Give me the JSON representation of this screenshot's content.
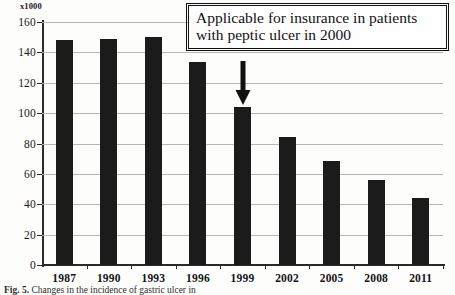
{
  "chart_data": {
    "type": "bar",
    "title": "",
    "subtitle": "",
    "xlabel": "",
    "ylabel": "",
    "unit_label": "x1000",
    "categories": [
      "1987",
      "1990",
      "1993",
      "1996",
      "1999",
      "2002",
      "2005",
      "2008",
      "2011"
    ],
    "values": [
      148,
      148.5,
      150,
      133.5,
      104,
      84,
      68.5,
      56,
      44
    ],
    "series": [
      {
        "name": "",
        "values": [
          148,
          148.5,
          150,
          133.5,
          104,
          84,
          68.5,
          56,
          44
        ]
      }
    ],
    "ylim": [
      0,
      160
    ],
    "ytick_labels": [
      "0",
      "20",
      "40",
      "60",
      "80",
      "100",
      "120",
      "140",
      "160"
    ],
    "ytick_values": [
      0,
      20,
      40,
      60,
      80,
      100,
      120,
      140,
      160
    ],
    "grid": true,
    "grid_axis": "y",
    "legend": false,
    "legend_position": "none",
    "bar_color": "#1b1b1b",
    "gridline_color": "#b9b9b4",
    "axis_color": "#2a2a2a",
    "background_color": "#fdfdfc",
    "annotations": [
      {
        "name": "callout",
        "lines": [
          "Applicable for insurance in patients",
          "with peptic ulcer in 2000"
        ],
        "points_to_category": "1999",
        "arrow": "down-arrow"
      }
    ]
  },
  "caption": {
    "label": "Fig. 5.",
    "text": "Changes in the incidence of gastric ulcer in"
  }
}
